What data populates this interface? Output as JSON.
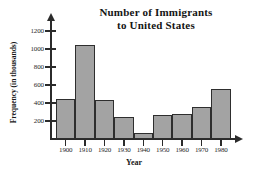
{
  "chart_data": {
    "type": "bar",
    "title": "Number of Immigrants to United States",
    "title_line1": "Number of Immigrants",
    "title_line2": "to United States",
    "xlabel": "Year",
    "ylabel": "Frequency (in thousands)",
    "categories": [
      "1900",
      "1910",
      "1920",
      "1930",
      "1940",
      "1950",
      "1960",
      "1970",
      "1980"
    ],
    "values": [
      450,
      1050,
      430,
      245,
      70,
      265,
      280,
      355,
      555
    ],
    "ylim": [
      0,
      1200
    ],
    "yticks": [
      200,
      400,
      600,
      800,
      1000,
      1200
    ],
    "ytick_labels": [
      "200",
      "400",
      "600",
      "800",
      "1000",
      "1200"
    ],
    "grid": false,
    "legend": "none",
    "bar_color": "#a3a3a3",
    "bar_edge_color": "#2e2e2e",
    "axis_color": "#2b2b2b",
    "background": "#ffffff"
  }
}
